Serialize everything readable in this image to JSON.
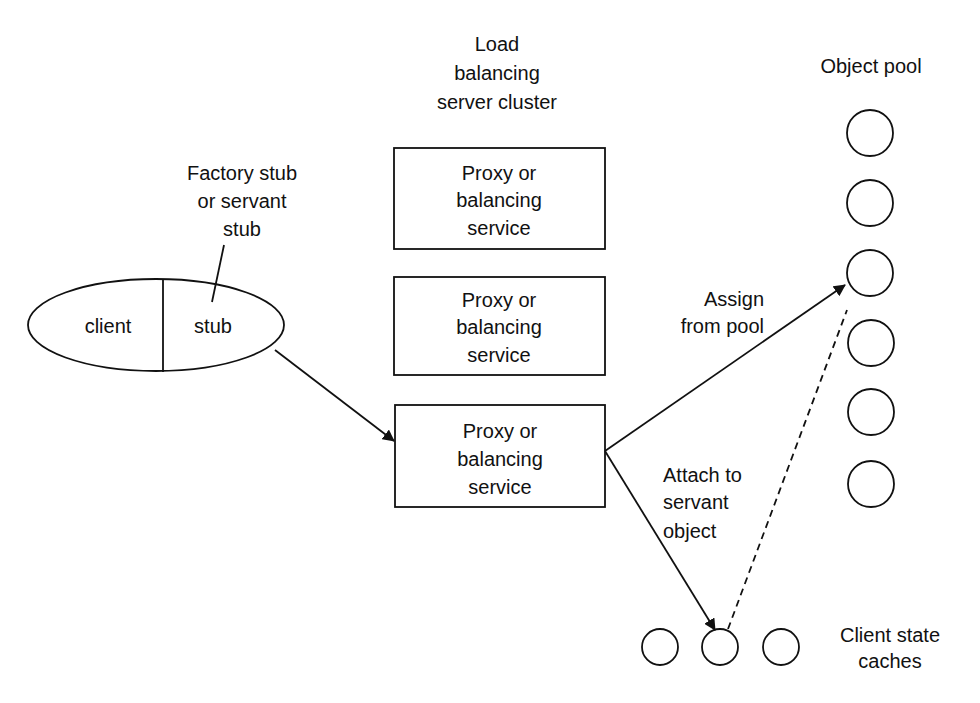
{
  "diagram": {
    "cluster_label": [
      "Load",
      "balancing",
      "server cluster"
    ],
    "pool_label": "Object pool",
    "stub_note": [
      "Factory stub",
      "or servant",
      "stub"
    ],
    "client": {
      "left": "client",
      "right": "stub"
    },
    "proxy_boxes": [
      {
        "lines": [
          "Proxy or",
          "balancing",
          "service"
        ]
      },
      {
        "lines": [
          "Proxy or",
          "balancing",
          "service"
        ]
      },
      {
        "lines": [
          "Proxy or",
          "balancing",
          "service"
        ]
      }
    ],
    "assign_label": [
      "Assign",
      "from pool"
    ],
    "attach_label": [
      "Attach to",
      "servant",
      "object"
    ],
    "caches_label": [
      "Client state",
      "caches"
    ],
    "pool_object_count": 6,
    "cache_count": 3,
    "colors": {
      "line": "#111111",
      "background": "#ffffff"
    }
  }
}
